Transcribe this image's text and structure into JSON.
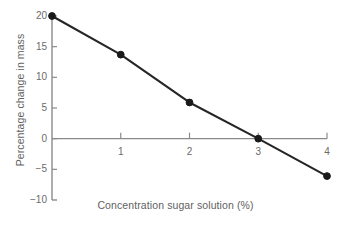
{
  "chart_data": {
    "type": "line",
    "title": "",
    "xlabel": "Concentration sugar solution (%)",
    "ylabel": "Percentage change in mass",
    "x": [
      0,
      1,
      2,
      3,
      4
    ],
    "values": [
      20.0,
      13.7,
      5.9,
      0.0,
      -6.1
    ],
    "series": [
      {
        "name": "Percentage change in mass",
        "values": [
          20.0,
          13.7,
          5.9,
          0.0,
          -6.1
        ]
      }
    ],
    "xlim": [
      0,
      4
    ],
    "ylim": [
      -10,
      20
    ],
    "xticks": [
      1,
      2,
      3,
      4
    ],
    "xtick_labels": [
      "1",
      "2",
      "3",
      "4"
    ],
    "yticks": [
      20,
      15,
      10,
      5,
      0,
      -5,
      -10
    ],
    "ytick_labels": [
      "20",
      "15",
      "10",
      "5",
      "0",
      "−5",
      "−10"
    ],
    "grid": false,
    "legend": false,
    "legend_position": "none",
    "marker": "circle",
    "colors": {
      "line": "#262626",
      "marker": "#1a1a1a",
      "axis": "#8a8a8a",
      "tick_text": "#6b6b6b",
      "axis_title": "#5f5f5f",
      "background": "#ffffff"
    }
  }
}
